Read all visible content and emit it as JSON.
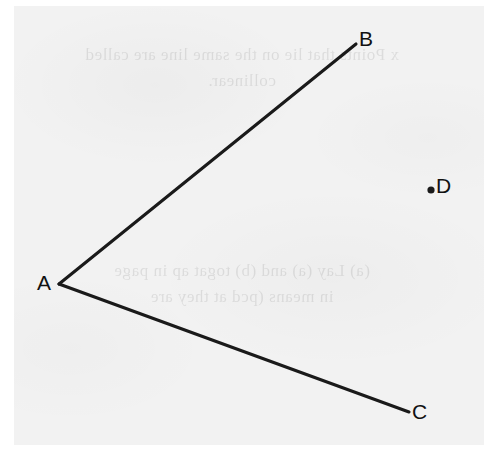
{
  "figure": {
    "name": "angle-with-external-point",
    "type": "geometry-diagram",
    "background_color": "#f2f2f2",
    "page_color": "#ffffff",
    "ink_color": "#1a1a1a",
    "canvas": {
      "width": 484,
      "height": 465
    },
    "points": [
      {
        "id": "A",
        "label": "A",
        "role": "vertex",
        "x": 59,
        "y": 284,
        "dot": false,
        "label_x": 37,
        "label_y": 272
      },
      {
        "id": "B",
        "label": "B",
        "role": "ray-end",
        "x": 356,
        "y": 44,
        "dot": false,
        "label_x": 359,
        "label_y": 28
      },
      {
        "id": "C",
        "label": "C",
        "role": "ray-end",
        "x": 409,
        "y": 412,
        "dot": false,
        "label_x": 412,
        "label_y": 401
      },
      {
        "id": "D",
        "label": "D",
        "role": "isolated-point",
        "x": 431,
        "y": 190,
        "dot": true,
        "dot_radius": 3.6,
        "label_x": 436,
        "label_y": 175
      }
    ],
    "segments": [
      {
        "id": "AB",
        "from": "A",
        "to": "B",
        "x1": 59,
        "y1": 284,
        "x2": 356,
        "y2": 44,
        "stroke_width": 3.1
      },
      {
        "id": "AC",
        "from": "A",
        "to": "C",
        "x1": 59,
        "y1": 284,
        "x2": 409,
        "y2": 412,
        "stroke_width": 3.1
      }
    ]
  },
  "bleed_through": {
    "description": "mirrored show-through text from reverse side of page, illegible",
    "top_block": [
      "x Points that lie on the same line are called",
      "collinear."
    ],
    "bottom_block": [
      "(a) Lay (a) and (b) togat ap in page",
      "in means (pcd at they are"
    ]
  }
}
